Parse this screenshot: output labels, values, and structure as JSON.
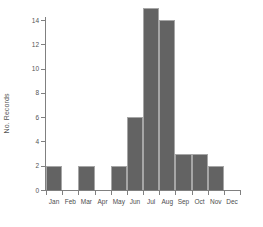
{
  "chart_data": {
    "type": "bar",
    "title": "",
    "subtitle": "",
    "xlabel": "",
    "ylabel": "No. Records",
    "categories": [
      "Jan",
      "Feb",
      "Mar",
      "Apr",
      "May",
      "Jun",
      "Jul",
      "Aug",
      "Sep",
      "Oct",
      "Nov",
      "Dec"
    ],
    "values": [
      2,
      0,
      2,
      0,
      2,
      6,
      15,
      14,
      3,
      3,
      2,
      0
    ],
    "ylim": [
      0,
      15
    ],
    "xlim": [
      0,
      12
    ],
    "yticks": [
      0,
      2,
      4,
      6,
      8,
      10,
      12,
      14
    ],
    "ytick_labels": [
      "0",
      "2",
      "4",
      "6",
      "8",
      "10",
      "12",
      "14"
    ],
    "grid": false,
    "legend": null,
    "legend_position": "none",
    "bar_color": "#636363",
    "bar_border_color": "#a6a6a6",
    "axis_color": "#808080",
    "text_color": "#4d4d4d",
    "background": "#ffffff",
    "annotations": []
  }
}
